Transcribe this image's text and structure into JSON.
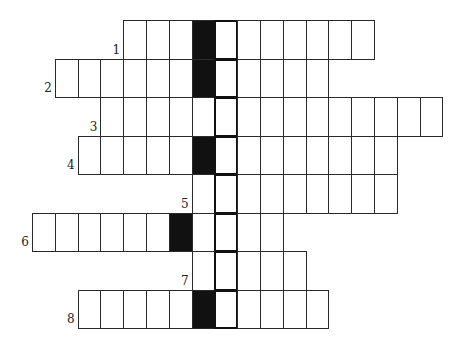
{
  "puzzle": {
    "type": "crossword",
    "colors": {
      "line": "#2a2a2a",
      "black_cell": "#111111",
      "background": "#ffffff"
    },
    "key_column": 8,
    "rows": [
      {
        "number": "1",
        "start_col": 4,
        "end_col": 14,
        "black_cols": [
          7
        ]
      },
      {
        "number": "2",
        "start_col": 1,
        "end_col": 12,
        "black_cols": [
          7
        ]
      },
      {
        "number": "3",
        "start_col": 3,
        "end_col": 17,
        "black_cols": []
      },
      {
        "number": "4",
        "start_col": 2,
        "end_col": 15,
        "black_cols": [
          7
        ]
      },
      {
        "number": "5",
        "start_col": 7,
        "end_col": 15,
        "black_cols": []
      },
      {
        "number": "6",
        "start_col": 0,
        "end_col": 10,
        "black_cols": [
          6
        ]
      },
      {
        "number": "7",
        "start_col": 7,
        "end_col": 11,
        "black_cols": []
      },
      {
        "number": "8",
        "start_col": 2,
        "end_col": 12,
        "black_cols": [
          7
        ]
      }
    ]
  }
}
